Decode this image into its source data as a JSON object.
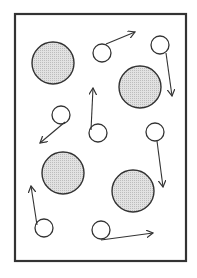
{
  "diagram": {
    "colors": {
      "stroke": "#333333",
      "large_fill": "#d9d9d9",
      "small_fill": "#ffffff",
      "background": "#ffffff"
    },
    "frame": {
      "x": 15,
      "y": 14,
      "width": 171,
      "height": 247
    },
    "large_particles": [
      {
        "cx": 53,
        "cy": 63,
        "r": 21
      },
      {
        "cx": 140,
        "cy": 87,
        "r": 21
      },
      {
        "cx": 63,
        "cy": 173,
        "r": 21
      },
      {
        "cx": 133,
        "cy": 191,
        "r": 21
      }
    ],
    "small_particles": [
      {
        "cx": 102,
        "cy": 53,
        "r": 9,
        "arrow": {
          "x1": 106,
          "y1": 44,
          "x2": 135,
          "y2": 32
        }
      },
      {
        "cx": 160,
        "cy": 45,
        "r": 9,
        "arrow": {
          "x1": 166,
          "y1": 53,
          "x2": 172,
          "y2": 96
        }
      },
      {
        "cx": 61,
        "cy": 115,
        "r": 9,
        "arrow": {
          "x1": 65,
          "y1": 122,
          "x2": 40,
          "y2": 143
        }
      },
      {
        "cx": 98,
        "cy": 133,
        "r": 9,
        "arrow": {
          "x1": 91,
          "y1": 130,
          "x2": 93,
          "y2": 88
        }
      },
      {
        "cx": 155,
        "cy": 132,
        "r": 9,
        "arrow": {
          "x1": 157,
          "y1": 141,
          "x2": 163,
          "y2": 187
        }
      },
      {
        "cx": 44,
        "cy": 228,
        "r": 9,
        "arrow": {
          "x1": 37,
          "y1": 225,
          "x2": 31,
          "y2": 186
        }
      },
      {
        "cx": 101,
        "cy": 230,
        "r": 9,
        "arrow": {
          "x1": 101,
          "y1": 240,
          "x2": 153,
          "y2": 233
        }
      }
    ]
  }
}
